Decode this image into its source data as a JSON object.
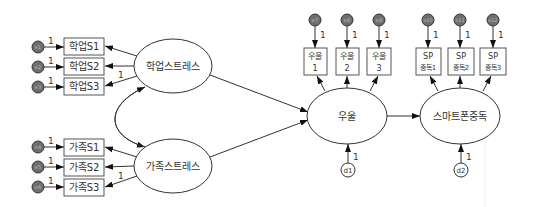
{
  "diagram": {
    "latent": {
      "academic_stress": "학업스트레스",
      "family_stress": "가족스트레스",
      "depression": "우울",
      "smartphone_addiction": "스마트폰중독"
    },
    "indicators": {
      "academic": [
        "학업S1",
        "학업S2",
        "학업S3"
      ],
      "family": [
        "가족S1",
        "가족S2",
        "가족S3"
      ],
      "depression": [
        [
          "우울",
          "1"
        ],
        [
          "우울",
          "2"
        ],
        [
          "우울",
          "3"
        ]
      ],
      "smartphone": [
        [
          "SP",
          "중독1"
        ],
        [
          "SP",
          "중독2"
        ],
        [
          "SP",
          "중독3"
        ]
      ]
    },
    "errors": [
      "e1",
      "e2",
      "e3",
      "e4",
      "e5",
      "e6",
      "e7",
      "e8",
      "e9",
      "e10",
      "e11",
      "e12"
    ],
    "disturbances": [
      "d1",
      "d2"
    ],
    "fixed_loading": "1"
  }
}
